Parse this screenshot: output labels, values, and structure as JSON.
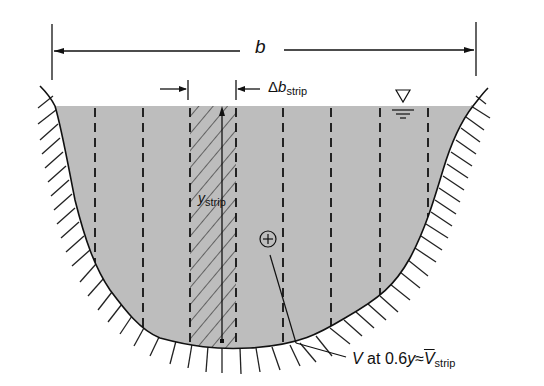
{
  "figure": {
    "labels": {
      "width_symbol": "b",
      "strip_width_delta": "Δ",
      "strip_width_symbol": "b",
      "strip_width_subscript": "strip",
      "strip_depth_symbol": "y",
      "strip_depth_subscript": "strip",
      "velocity_symbol": "V",
      "velocity_text": " at 0.6",
      "velocity_depth_symbol": "y",
      "approx_symbol": "≈",
      "mean_velocity_symbol": "V",
      "mean_velocity_subscript": "strip"
    },
    "icons": {
      "water_surface": "inverted-triangle-water-level-icon",
      "measurement_point": "circled-plus-icon"
    },
    "colors": {
      "water_fill": "#bdbdbd",
      "line": "#111111",
      "background": "#ffffff"
    },
    "strip_count": 9,
    "dashed_line_positions_px": [
      95,
      143,
      190,
      236,
      283,
      331,
      380,
      428
    ]
  }
}
